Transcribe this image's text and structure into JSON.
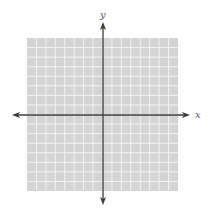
{
  "diagram": {
    "type": "coordinate-plane",
    "x_axis_label": "x",
    "y_axis_label": "y",
    "grid": {
      "columns": 16,
      "rows": 16,
      "units_each_direction": 8,
      "left": 27,
      "top": 38,
      "right": 178,
      "bottom": 191,
      "fill_color": "#d4d4d4",
      "line_color": "#f2f2f2"
    },
    "origin": {
      "x": 103,
      "y": 115
    },
    "axis_color": "#3c3c3c",
    "x_axis": {
      "start": 12,
      "end": 190
    },
    "y_axis": {
      "start": 22,
      "end": 205
    }
  }
}
